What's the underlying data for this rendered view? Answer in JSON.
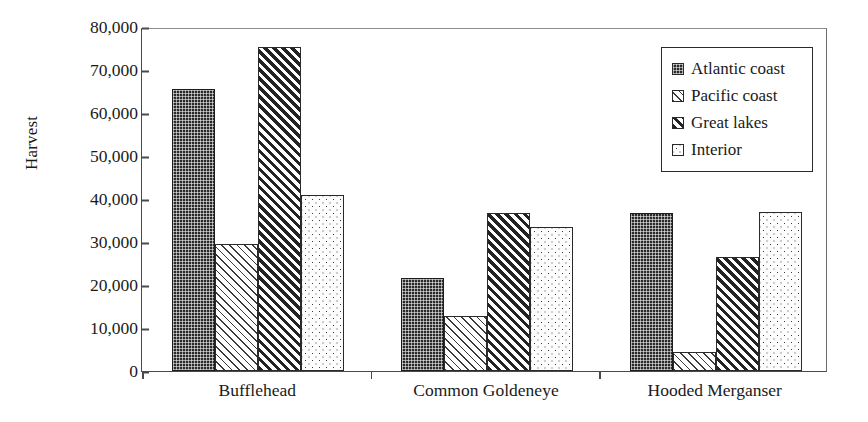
{
  "chart_data": {
    "type": "bar",
    "title": "",
    "xlabel": "",
    "ylabel": "Harvest",
    "categories": [
      "Bufflehead",
      "Common Goldeneye",
      "Hooded Merganser"
    ],
    "series": [
      {
        "name": "Atlantic coast",
        "values": [
          65500,
          21700,
          36800
        ],
        "pattern": "dark-dotted-grid"
      },
      {
        "name": "Pacific coast",
        "values": [
          29600,
          12700,
          4400
        ],
        "pattern": "light-diagonal-hatch"
      },
      {
        "name": "Great lakes",
        "values": [
          75400,
          36700,
          26400
        ],
        "pattern": "dark-diagonal-hatch"
      },
      {
        "name": "Interior",
        "values": [
          41000,
          33400,
          36900
        ],
        "pattern": "light-dotted"
      }
    ],
    "ylim": [
      0,
      80000
    ],
    "ytick_values": [
      0,
      10000,
      20000,
      30000,
      40000,
      50000,
      60000,
      70000,
      80000
    ],
    "ytick_labels": [
      "0",
      "10,000",
      "20,000",
      "30,000",
      "40,000",
      "50,000",
      "60,000",
      "70,000",
      "80,000"
    ],
    "grid": false,
    "legend_position": "top-right",
    "legend_entries": [
      "Atlantic coast",
      "Pacific coast",
      "Great lakes",
      "Interior"
    ]
  }
}
